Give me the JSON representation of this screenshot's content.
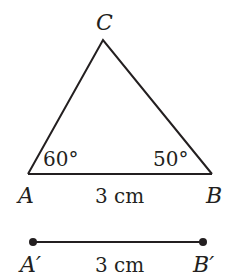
{
  "diagram": {
    "triangle": {
      "vertices": {
        "A": {
          "label": "A"
        },
        "B": {
          "label": "B"
        },
        "C": {
          "label": "C"
        }
      },
      "angle_A": "60°",
      "angle_B": "50°",
      "side_AB": "3 cm"
    },
    "segment": {
      "start_label": "A′",
      "end_label": "B′",
      "length": "3 cm"
    },
    "colors": {
      "stroke": "#231f20",
      "background": "#ffffff"
    }
  }
}
